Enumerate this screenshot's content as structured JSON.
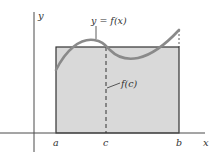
{
  "figure": {
    "colors": {
      "background": "#ffffff",
      "axis": "#4a4a4a",
      "rectangle_fill": "#d9d9d9",
      "rectangle_stroke": "#333333",
      "curve": "#8a8a8a",
      "text": "#333333"
    },
    "labels": {
      "y_axis": "y",
      "x_axis": "x",
      "curve": "y = f(x)",
      "height": "f(c)",
      "a": "a",
      "c": "c",
      "b": "b"
    }
  }
}
